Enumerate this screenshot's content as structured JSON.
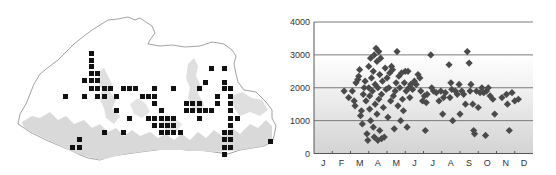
{
  "chart_data": [
    {
      "type": "map",
      "title": "",
      "description": "Distribution grid map: black squares mark occupied grid cells over a country outline; light gray shading shows lowland/forest relief",
      "colors": {
        "outline": "#8a8a8a",
        "land": "#ffffff",
        "relief": "#d6d6d6",
        "occupied_cell": "#111111"
      },
      "cell_size_px": 5,
      "occupied_cells": [
        [
          89,
          51
        ],
        [
          89,
          58
        ],
        [
          89,
          64
        ],
        [
          89,
          71
        ],
        [
          95,
          71
        ],
        [
          209,
          66
        ],
        [
          222,
          66
        ],
        [
          82,
          78
        ],
        [
          89,
          78
        ],
        [
          95,
          78
        ],
        [
          203,
          80
        ],
        [
          222,
          80
        ],
        [
          89,
          86
        ],
        [
          95,
          86
        ],
        [
          102,
          86
        ],
        [
          108,
          86
        ],
        [
          121,
          86
        ],
        [
          127,
          86
        ],
        [
          133,
          86
        ],
        [
          152,
          86
        ],
        [
          171,
          86
        ],
        [
          197,
          86
        ],
        [
          222,
          86
        ],
        [
          228,
          86
        ],
        [
          63,
          94
        ],
        [
          82,
          94
        ],
        [
          95,
          94
        ],
        [
          102,
          94
        ],
        [
          114,
          94
        ],
        [
          140,
          94
        ],
        [
          146,
          94
        ],
        [
          152,
          94
        ],
        [
          215,
          94
        ],
        [
          228,
          94
        ],
        [
          152,
          101
        ],
        [
          184,
          101
        ],
        [
          190,
          101
        ],
        [
          197,
          101
        ],
        [
          215,
          101
        ],
        [
          228,
          101
        ],
        [
          114,
          108
        ],
        [
          159,
          108
        ],
        [
          184,
          108
        ],
        [
          190,
          108
        ],
        [
          197,
          108
        ],
        [
          203,
          108
        ],
        [
          209,
          108
        ],
        [
          228,
          108
        ],
        [
          127,
          116
        ],
        [
          146,
          116
        ],
        [
          152,
          116
        ],
        [
          159,
          116
        ],
        [
          165,
          116
        ],
        [
          171,
          116
        ],
        [
          197,
          116
        ],
        [
          228,
          116
        ],
        [
          235,
          116
        ],
        [
          152,
          123
        ],
        [
          159,
          123
        ],
        [
          165,
          123
        ],
        [
          171,
          123
        ],
        [
          228,
          123
        ],
        [
          102,
          130
        ],
        [
          121,
          130
        ],
        [
          159,
          130
        ],
        [
          165,
          130
        ],
        [
          171,
          130
        ],
        [
          178,
          130
        ],
        [
          222,
          130
        ],
        [
          228,
          130
        ],
        [
          77,
          137
        ],
        [
          222,
          137
        ],
        [
          228,
          137
        ],
        [
          268,
          139
        ],
        [
          70,
          145
        ],
        [
          77,
          145
        ],
        [
          222,
          145
        ],
        [
          228,
          145
        ],
        [
          222,
          152
        ]
      ]
    },
    {
      "type": "scatter",
      "title": "",
      "xlabel": "",
      "ylabel": "",
      "x_categories": [
        "J",
        "F",
        "M",
        "A",
        "M",
        "J",
        "J",
        "A",
        "S",
        "O",
        "N",
        "D"
      ],
      "yticks": [
        0,
        1000,
        2000,
        3000,
        4000
      ],
      "ytick_labels": [
        "0",
        "1000",
        "2000",
        "3000",
        "4000"
      ],
      "ylim": [
        0,
        4000
      ],
      "xlim": [
        0,
        12
      ],
      "grid": "horizontal lines at 1000, 2000, 3000, 4000",
      "background": "vertical gradient white (top) to light gray (bottom)",
      "marker": "diamond",
      "marker_color": "#4a4a4a",
      "series": [
        {
          "name": "records",
          "points_month_fraction_vs_elevation": [
            [
              1.65,
              1900
            ],
            [
              1.9,
              1700
            ],
            [
              2.1,
              1900
            ],
            [
              2.2,
              1600
            ],
            [
              2.25,
              1450
            ],
            [
              2.3,
              2150
            ],
            [
              2.4,
              2250
            ],
            [
              2.45,
              2350
            ],
            [
              2.5,
              2550
            ],
            [
              2.55,
              1150
            ],
            [
              2.6,
              1300
            ],
            [
              2.65,
              900
            ],
            [
              2.7,
              1800
            ],
            [
              2.75,
              2000
            ],
            [
              2.8,
              2200
            ],
            [
              2.85,
              1600
            ],
            [
              2.9,
              600
            ],
            [
              2.95,
              400
            ],
            [
              3.0,
              2650
            ],
            [
              3.0,
              2000
            ],
            [
              3.05,
              1750
            ],
            [
              3.05,
              1350
            ],
            [
              3.1,
              2900
            ],
            [
              3.1,
              1000
            ],
            [
              3.15,
              2300
            ],
            [
              3.2,
              1900
            ],
            [
              3.25,
              2500
            ],
            [
              3.25,
              800
            ],
            [
              3.3,
              3000
            ],
            [
              3.3,
              500
            ],
            [
              3.35,
              1500
            ],
            [
              3.35,
              2100
            ],
            [
              3.4,
              3200
            ],
            [
              3.45,
              2800
            ],
            [
              3.45,
              1200
            ],
            [
              3.5,
              2000
            ],
            [
              3.5,
              400
            ],
            [
              3.55,
              3100
            ],
            [
              3.55,
              1650
            ],
            [
              3.6,
              2400
            ],
            [
              3.6,
              700
            ],
            [
              3.65,
              2900
            ],
            [
              3.7,
              1800
            ],
            [
              3.7,
              450
            ],
            [
              3.75,
              2200
            ],
            [
              3.8,
              1400
            ],
            [
              3.85,
              500
            ],
            [
              3.9,
              2600
            ],
            [
              3.95,
              1950
            ],
            [
              4.0,
              2300
            ],
            [
              4.05,
              1100
            ],
            [
              4.1,
              2000
            ],
            [
              4.15,
              2450
            ],
            [
              4.2,
              1600
            ],
            [
              4.25,
              2650
            ],
            [
              4.3,
              2550
            ],
            [
              4.35,
              1750
            ],
            [
              4.4,
              750
            ],
            [
              4.45,
              1900
            ],
            [
              4.5,
              2150
            ],
            [
              4.55,
              3100
            ],
            [
              4.6,
              1450
            ],
            [
              4.65,
              2350
            ],
            [
              4.7,
              2000
            ],
            [
              4.75,
              1000
            ],
            [
              4.8,
              2450
            ],
            [
              4.85,
              1650
            ],
            [
              4.9,
              1300
            ],
            [
              4.95,
              2150
            ],
            [
              5.0,
              2500
            ],
            [
              5.05,
              1900
            ],
            [
              5.1,
              800
            ],
            [
              5.15,
              2500
            ],
            [
              5.2,
              2000
            ],
            [
              5.25,
              1700
            ],
            [
              5.3,
              2100
            ],
            [
              5.4,
              1950
            ],
            [
              5.5,
              2200
            ],
            [
              5.6,
              2100
            ],
            [
              5.7,
              2400
            ],
            [
              5.8,
              2300
            ],
            [
              5.85,
              1900
            ],
            [
              5.95,
              1600
            ],
            [
              6.05,
              1750
            ],
            [
              6.1,
              700
            ],
            [
              6.15,
              1550
            ],
            [
              6.2,
              1800
            ],
            [
              6.4,
              3000
            ],
            [
              6.45,
              2000
            ],
            [
              6.55,
              1900
            ],
            [
              6.7,
              1850
            ],
            [
              6.85,
              1600
            ],
            [
              6.95,
              1900
            ],
            [
              7.05,
              1200
            ],
            [
              7.1,
              1700
            ],
            [
              7.2,
              1850
            ],
            [
              7.4,
              2700
            ],
            [
              7.45,
              1700
            ],
            [
              7.5,
              2150
            ],
            [
              7.55,
              1950
            ],
            [
              7.6,
              1000
            ],
            [
              7.75,
              1900
            ],
            [
              7.85,
              1800
            ],
            [
              7.95,
              2100
            ],
            [
              8.0,
              1200
            ],
            [
              8.1,
              1900
            ],
            [
              8.2,
              1800
            ],
            [
              8.3,
              1500
            ],
            [
              8.4,
              3100
            ],
            [
              8.5,
              2750
            ],
            [
              8.55,
              1900
            ],
            [
              8.6,
              2100
            ],
            [
              8.7,
              1500
            ],
            [
              8.75,
              700
            ],
            [
              8.8,
              600
            ],
            [
              8.9,
              1900
            ],
            [
              9.0,
              1400
            ],
            [
              9.1,
              1850
            ],
            [
              9.2,
              2000
            ],
            [
              9.3,
              1850
            ],
            [
              9.4,
              550
            ],
            [
              9.45,
              1900
            ],
            [
              9.55,
              2000
            ],
            [
              9.65,
              1750
            ],
            [
              9.8,
              1650
            ],
            [
              9.9,
              1200
            ],
            [
              10.3,
              1700
            ],
            [
              10.55,
              1800
            ],
            [
              10.6,
              1500
            ],
            [
              10.7,
              700
            ],
            [
              10.85,
              1850
            ],
            [
              11.0,
              1600
            ],
            [
              11.2,
              1650
            ]
          ]
        }
      ]
    }
  ],
  "axis": {
    "y_labels": [
      "4000",
      "3000",
      "2000",
      "1000",
      "0"
    ],
    "x_labels": [
      "J",
      "F",
      "M",
      "A",
      "M",
      "J",
      "J",
      "A",
      "S",
      "O",
      "N",
      "D"
    ]
  }
}
